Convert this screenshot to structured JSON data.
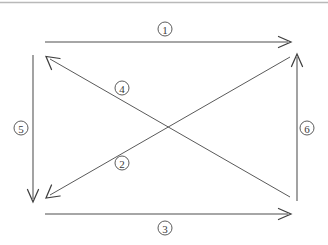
{
  "diagram": {
    "type": "arrow-flow-diagram",
    "title": "",
    "canvas": {
      "width": 328,
      "height": 245,
      "background": "#ffffff"
    },
    "colors": {
      "stroke": "#4f4f4f",
      "diagonal_stroke": "#5a5a5a",
      "arrowhead": "#3f3f3f",
      "label_text": "#3a3a3a",
      "label_ring": "#4a4a4a",
      "top_rule": "#b9b9b9",
      "background": "#ffffff"
    },
    "top_rule": {
      "name": "top-horizontal-rule",
      "y": 2,
      "x1": 0,
      "x2": 328
    },
    "arrows": [
      {
        "id": "arrow-1",
        "label": "1",
        "label_glyph": "①",
        "orientation": "horizontal",
        "direction": "left-to-right",
        "from": {
          "x": 45,
          "y": 42
        },
        "to": {
          "x": 290,
          "y": 42
        },
        "arrowhead_at": "end",
        "label_pos": {
          "x": 165,
          "y": 29
        },
        "label_side": "above"
      },
      {
        "id": "arrow-2",
        "label": "2",
        "label_glyph": "②",
        "orientation": "diagonal",
        "direction": "upper-right-to-lower-left",
        "from": {
          "x": 290,
          "y": 57
        },
        "to": {
          "x": 47,
          "y": 197
        },
        "arrowhead_at": "end",
        "label_pos": {
          "x": 122,
          "y": 163
        },
        "label_side": "below-right-of-line"
      },
      {
        "id": "arrow-3",
        "label": "3",
        "label_glyph": "③",
        "orientation": "horizontal",
        "direction": "left-to-right",
        "from": {
          "x": 45,
          "y": 214
        },
        "to": {
          "x": 290,
          "y": 214
        },
        "arrowhead_at": "end",
        "label_pos": {
          "x": 165,
          "y": 228
        },
        "label_side": "below"
      },
      {
        "id": "arrow-4",
        "label": "4",
        "label_glyph": "④",
        "orientation": "diagonal",
        "direction": "lower-right-to-upper-left",
        "from": {
          "x": 290,
          "y": 197
        },
        "to": {
          "x": 47,
          "y": 57
        },
        "arrowhead_at": "end",
        "label_pos": {
          "x": 122,
          "y": 88
        },
        "label_side": "above-right-of-line"
      },
      {
        "id": "arrow-5",
        "label": "5",
        "label_glyph": "⑤",
        "orientation": "vertical",
        "direction": "top-to-bottom",
        "from": {
          "x": 33,
          "y": 55
        },
        "to": {
          "x": 33,
          "y": 201
        },
        "arrowhead_at": "end",
        "label_pos": {
          "x": 21,
          "y": 128
        },
        "label_side": "left"
      },
      {
        "id": "arrow-6",
        "label": "6",
        "label_glyph": "⑥",
        "orientation": "vertical",
        "direction": "bottom-to-top",
        "from": {
          "x": 297,
          "y": 201
        },
        "to": {
          "x": 297,
          "y": 55
        },
        "arrowhead_at": "end",
        "label_pos": {
          "x": 307,
          "y": 128
        },
        "label_side": "right"
      }
    ],
    "crossing_point": {
      "x": 168,
      "y": 127
    }
  }
}
